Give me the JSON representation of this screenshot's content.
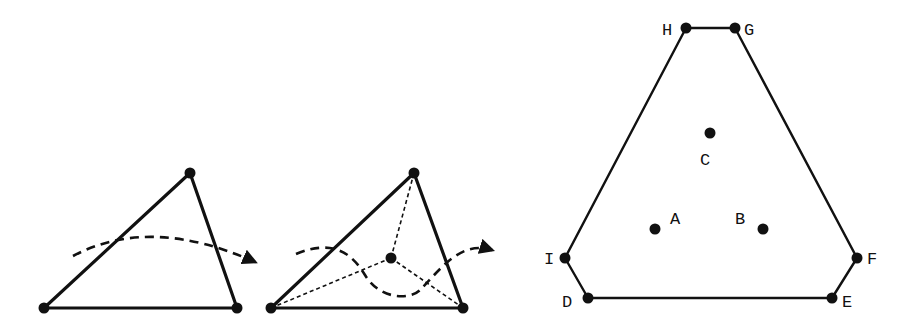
{
  "figure": {
    "panels": [
      {
        "id": "left",
        "description": "Triangle crossed by a curved dashed path with arrow",
        "vertices": [
          [
            44,
            308
          ],
          [
            190,
            173
          ],
          [
            237,
            308
          ]
        ],
        "path": "M73,256 Q150,215 255,262"
      },
      {
        "id": "middle",
        "description": "Triangle subdivided from interior point; dashed path dips through it",
        "vertices": [
          [
            271,
            308
          ],
          [
            414,
            173
          ],
          [
            463,
            308
          ]
        ],
        "center": [
          391,
          258
        ],
        "path": "M296,254 C330,240 350,250 365,275 C380,300 410,300 420,290 C440,270 460,240 492,250"
      },
      {
        "id": "right",
        "description": "Octagon-like polygon containing labeled points A, B, C",
        "polygon_labels": [
          "H",
          "G",
          "F",
          "E",
          "D",
          "I"
        ],
        "polygon": [
          [
            686,
            28
          ],
          [
            735,
            28
          ],
          [
            857,
            258
          ],
          [
            832,
            298
          ],
          [
            588,
            298
          ],
          [
            565,
            258
          ]
        ],
        "interior_points": [
          {
            "label": "A",
            "pos": [
              655,
              229
            ]
          },
          {
            "label": "B",
            "pos": [
              763,
              229
            ]
          },
          {
            "label": "C",
            "pos": [
              710,
              133
            ]
          }
        ]
      }
    ],
    "labels": {
      "H": "H",
      "G": "G",
      "F": "F",
      "E": "E",
      "D": "D",
      "I": "I",
      "A": "A",
      "B": "B",
      "C": "C"
    },
    "colors": {
      "stroke": "#111111",
      "background": "#ffffff"
    }
  }
}
